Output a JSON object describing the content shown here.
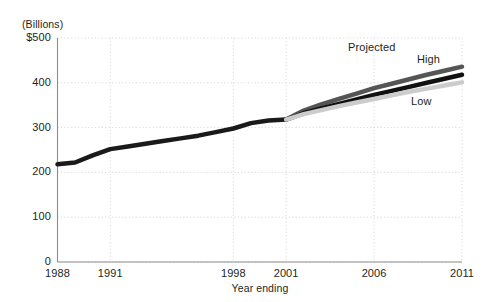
{
  "chart_data": {
    "type": "line",
    "title": "",
    "subtitle": "",
    "unit_label": "(Billions)",
    "xlabel": "Year ending",
    "ylabel": "",
    "xlim": [
      1988,
      2011
    ],
    "ylim": [
      0,
      500
    ],
    "grid": true,
    "grid_style": "dotted",
    "legend_position": "inline-annotations",
    "y_ticks": [
      0,
      100,
      200,
      300,
      400,
      500
    ],
    "y_tick_labels": [
      "0",
      "100",
      "200",
      "300",
      "400",
      "$500"
    ],
    "x_ticks": [
      1988,
      1991,
      1998,
      2001,
      2006,
      2011
    ],
    "x_tick_labels": [
      "1988",
      "1991",
      "1998",
      "2001",
      "2006",
      "2011"
    ],
    "annotations": [
      {
        "text": "Projected",
        "x_px": 348,
        "y_px": 41
      },
      {
        "text": "High",
        "x_px": 417,
        "y_px": 53
      },
      {
        "text": "Low",
        "x_px": 411,
        "y_px": 95
      }
    ],
    "projection_start_year": 2001,
    "series": [
      {
        "name": "Actual",
        "color": "#1a1a1a",
        "width": 4.5,
        "x": [
          1988,
          1989,
          1990,
          1991,
          1992,
          1993,
          1994,
          1995,
          1996,
          1997,
          1998,
          1999,
          2000,
          2001
        ],
        "values": [
          218,
          222,
          238,
          252,
          258,
          264,
          270,
          276,
          282,
          290,
          298,
          310,
          316,
          318
        ]
      },
      {
        "name": "High",
        "color": "#555555",
        "width": 4.5,
        "x": [
          2001,
          2002,
          2003,
          2004,
          2005,
          2006,
          2007,
          2008,
          2009,
          2010,
          2011
        ],
        "values": [
          318,
          338,
          352,
          364,
          376,
          388,
          398,
          408,
          418,
          427,
          436
        ]
      },
      {
        "name": "Mid",
        "color": "#111111",
        "width": 4.5,
        "x": [
          2001,
          2002,
          2003,
          2004,
          2005,
          2006,
          2007,
          2008,
          2009,
          2010,
          2011
        ],
        "values": [
          318,
          332,
          343,
          353,
          363,
          373,
          382,
          391,
          400,
          409,
          418
        ]
      },
      {
        "name": "Low",
        "color": "#cccccc",
        "width": 4.5,
        "x": [
          2001,
          2002,
          2003,
          2004,
          2005,
          2006,
          2007,
          2008,
          2009,
          2010,
          2011
        ],
        "values": [
          318,
          330,
          339,
          348,
          356,
          364,
          372,
          380,
          387,
          394,
          401
        ]
      }
    ],
    "colors": {
      "axis": "#8c8c8c",
      "grid": "#d9d9d9",
      "text": "#231f20",
      "high": "#555555",
      "mid": "#111111",
      "low": "#cccccc"
    }
  }
}
